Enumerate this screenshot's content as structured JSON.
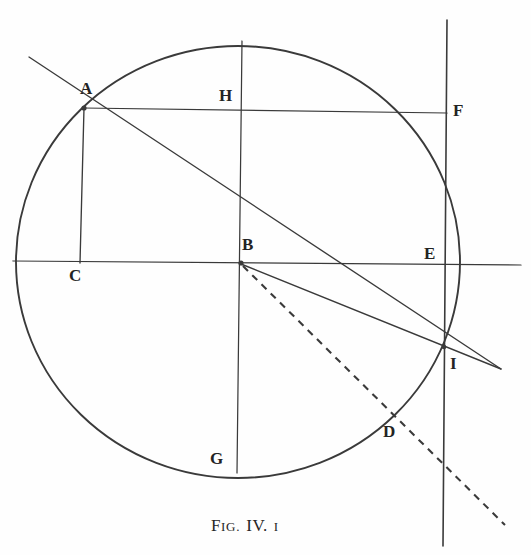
{
  "figure": {
    "caption": {
      "fig_prefix_big": "F",
      "fig_prefix_small": "IG.",
      "number_big": "IV.",
      "number_small": "I",
      "full_text": "FIG. IV. I"
    },
    "stroke_color": "#3a3a3a",
    "background_color": "#fefefe",
    "labels": [
      {
        "id": "A",
        "text": "A",
        "x": 80,
        "y": 80
      },
      {
        "id": "B",
        "text": "B",
        "x": 242,
        "y": 236
      },
      {
        "id": "C",
        "text": "C",
        "x": 69,
        "y": 267
      },
      {
        "id": "D",
        "text": "D",
        "x": 383,
        "y": 423
      },
      {
        "id": "E",
        "text": "E",
        "x": 424,
        "y": 245
      },
      {
        "id": "F",
        "text": "F",
        "x": 453,
        "y": 102
      },
      {
        "id": "G",
        "text": "G",
        "x": 210,
        "y": 450
      },
      {
        "id": "H",
        "text": "H",
        "x": 219,
        "y": 87
      },
      {
        "id": "I",
        "text": "I",
        "x": 450,
        "y": 355
      }
    ],
    "circle": {
      "center_x": 238,
      "center_y": 262,
      "radius": 222,
      "name": "main-circle"
    },
    "segments": [
      {
        "name": "horizontal-diameter",
        "x1": 13,
        "y1": 261,
        "x2": 521,
        "y2": 265,
        "style": "solid"
      },
      {
        "name": "vertical-diameter-hb-to-g",
        "x1": 242,
        "y1": 41,
        "x2": 237,
        "y2": 473,
        "style": "solid"
      },
      {
        "name": "chord-a-to-f",
        "x1": 83,
        "y1": 108,
        "x2": 447,
        "y2": 113,
        "style": "solid"
      },
      {
        "name": "perpendicular-a-to-c",
        "x1": 84,
        "y1": 108,
        "x2": 80,
        "y2": 263,
        "style": "solid"
      },
      {
        "name": "tangent-line-through-a-and-i",
        "x1": 29,
        "y1": 57,
        "x2": 501,
        "y2": 369,
        "style": "solid"
      },
      {
        "name": "vertical-tangent-at-e",
        "x1": 447,
        "y1": 20,
        "x2": 443,
        "y2": 546,
        "style": "solid"
      },
      {
        "name": "radius-b-to-i",
        "x1": 241,
        "y1": 264,
        "x2": 501,
        "y2": 369,
        "style": "solid"
      },
      {
        "name": "dashed-line-b-through-d",
        "x1": 243,
        "y1": 266,
        "x2": 505,
        "y2": 525,
        "style": "dashed"
      }
    ],
    "vertices": [
      {
        "name": "vertex-a",
        "x": 84,
        "y": 108
      },
      {
        "name": "vertex-b",
        "x": 241,
        "y": 263
      },
      {
        "name": "vertex-i",
        "x": 444,
        "y": 347
      }
    ]
  }
}
